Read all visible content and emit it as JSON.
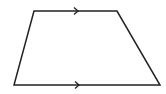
{
  "diagram": {
    "type": "trapezoid",
    "stroke_color": "#222222",
    "background": "#ffffff",
    "vertices": {
      "top_left": [
        34,
        11
      ],
      "top_right": [
        117,
        11
      ],
      "bottom_right": [
        160,
        85
      ],
      "bottom_left": [
        14,
        85
      ]
    },
    "parallel_marks": [
      {
        "side": "top",
        "x": 78,
        "y": 11,
        "direction": "right"
      },
      {
        "side": "bottom",
        "x": 79,
        "y": 85,
        "direction": "right"
      }
    ]
  }
}
